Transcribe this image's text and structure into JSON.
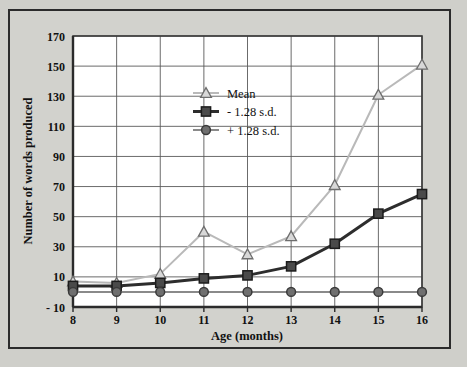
{
  "chart_data": {
    "type": "line",
    "title": "",
    "xlabel": "Age (months)",
    "ylabel": "Number of words produced",
    "x": [
      8,
      9,
      10,
      11,
      12,
      13,
      14,
      15,
      16
    ],
    "xticklabels": [
      "8",
      "9",
      "10",
      "11",
      "12",
      "13",
      "14",
      "15",
      "16"
    ],
    "yticks": [
      -10,
      10,
      30,
      50,
      70,
      90,
      110,
      130,
      150,
      170
    ],
    "yticklabels": [
      "- 10",
      "10",
      "30",
      "50",
      "70",
      "90",
      "110",
      "130",
      "150",
      "170"
    ],
    "xlim": [
      8,
      16
    ],
    "ylim": [
      -10,
      170
    ],
    "grid": true,
    "legend_position": "upper-center-left",
    "series": [
      {
        "name": "Mean",
        "values": [
          7,
          6,
          12,
          40,
          25,
          37,
          71,
          131,
          151
        ],
        "color": "#b9b9b9",
        "marker": "triangle-open",
        "marker_fill": "#d8d8d8",
        "linewidth": 2
      },
      {
        "name": "- 1.28 s.d.",
        "values": [
          4,
          4,
          6,
          9,
          11,
          17,
          32,
          52,
          65
        ],
        "color": "#2d2d2d",
        "marker": "square-filled",
        "marker_fill": "#4a4a4a",
        "linewidth": 3
      },
      {
        "name": "+ 1.28 s.d.",
        "values": [
          0,
          0,
          0,
          0,
          0,
          0,
          0,
          0,
          0
        ],
        "color": "#8a8a8a",
        "marker": "circle-filled",
        "marker_fill": "#6f6f6f",
        "linewidth": 2
      }
    ]
  },
  "figure": {
    "background_color": "#cfcfca",
    "plot_background_color": "#ffffff",
    "border_color": "#2b2b2b",
    "grid_color": "#5a5a5a"
  }
}
